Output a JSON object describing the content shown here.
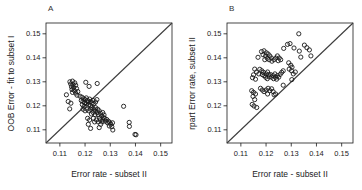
{
  "figure": {
    "background": "#ffffff",
    "axis_color": "#1a1a1a",
    "point_color": "#1a1a1a",
    "diagonal_color": "#3c3c3c",
    "panels": [
      {
        "label": "A",
        "xlabel": "Error rate - subset II",
        "ylabel": "OOB Error - fit to subset I"
      },
      {
        "label": "B",
        "xlabel": "Error rate - subset II",
        "ylabel": "rpart Error rate, subset II"
      }
    ]
  },
  "chart_data": [
    {
      "type": "scatter",
      "panel": "A",
      "title": "",
      "xlabel": "Error rate - subset II",
      "ylabel": "OOB Error - fit to subset I",
      "xlim": [
        0.1045,
        0.1545
      ],
      "ylim": [
        0.1045,
        0.1545
      ],
      "x_ticks": [
        0.11,
        0.12,
        0.13,
        0.14,
        0.15
      ],
      "y_ticks": [
        0.11,
        0.12,
        0.13,
        0.14,
        0.15
      ],
      "grid": false,
      "legend": "none",
      "marker": "open-circle",
      "reference_line": "identity diagonal y=x",
      "points": [
        [
          0.114,
          0.13
        ],
        [
          0.115,
          0.1303
        ],
        [
          0.1159,
          0.1296
        ],
        [
          0.1143,
          0.1291
        ],
        [
          0.1152,
          0.1288
        ],
        [
          0.1163,
          0.1286
        ],
        [
          0.1146,
          0.1279
        ],
        [
          0.1155,
          0.1276
        ],
        [
          0.1166,
          0.1272
        ],
        [
          0.1148,
          0.1268
        ],
        [
          0.1158,
          0.1263
        ],
        [
          0.115,
          0.1256
        ],
        [
          0.1163,
          0.1253
        ],
        [
          0.1171,
          0.1259
        ],
        [
          0.1168,
          0.1244
        ],
        [
          0.1126,
          0.1246
        ],
        [
          0.1133,
          0.1218
        ],
        [
          0.1139,
          0.1187
        ],
        [
          0.1144,
          0.1211
        ],
        [
          0.1203,
          0.1298
        ],
        [
          0.1248,
          0.1293
        ],
        [
          0.1216,
          0.1281
        ],
        [
          0.118,
          0.124
        ],
        [
          0.1188,
          0.1236
        ],
        [
          0.1195,
          0.1229
        ],
        [
          0.1185,
          0.1222
        ],
        [
          0.1192,
          0.1218
        ],
        [
          0.12,
          0.1226
        ],
        [
          0.1205,
          0.1233
        ],
        [
          0.121,
          0.1222
        ],
        [
          0.1198,
          0.1213
        ],
        [
          0.1206,
          0.1208
        ],
        [
          0.1212,
          0.1216
        ],
        [
          0.1218,
          0.1228
        ],
        [
          0.1221,
          0.1218
        ],
        [
          0.1215,
          0.1205
        ],
        [
          0.1222,
          0.12
        ],
        [
          0.1228,
          0.1212
        ],
        [
          0.1231,
          0.1222
        ],
        [
          0.1235,
          0.1209
        ],
        [
          0.1189,
          0.1205
        ],
        [
          0.1196,
          0.1198
        ],
        [
          0.1242,
          0.1216
        ],
        [
          0.1247,
          0.1226
        ],
        [
          0.1192,
          0.1186
        ],
        [
          0.12,
          0.1179
        ],
        [
          0.1208,
          0.1186
        ],
        [
          0.1215,
          0.1179
        ],
        [
          0.1222,
          0.1186
        ],
        [
          0.1228,
          0.1192
        ],
        [
          0.1235,
          0.1186
        ],
        [
          0.1242,
          0.1192
        ],
        [
          0.124,
          0.1179
        ],
        [
          0.1232,
          0.1172
        ],
        [
          0.1225,
          0.1166
        ],
        [
          0.124,
          0.1163
        ],
        [
          0.1248,
          0.1172
        ],
        [
          0.125,
          0.1186
        ],
        [
          0.1256,
          0.1179
        ],
        [
          0.1252,
          0.1163
        ],
        [
          0.1261,
          0.1169
        ],
        [
          0.1266,
          0.1158
        ],
        [
          0.1258,
          0.1149
        ],
        [
          0.127,
          0.1172
        ],
        [
          0.1275,
          0.1162
        ],
        [
          0.1272,
          0.1151
        ],
        [
          0.121,
          0.1148
        ],
        [
          0.1218,
          0.1141
        ],
        [
          0.1213,
          0.1123
        ],
        [
          0.1222,
          0.1106
        ],
        [
          0.1233,
          0.1148
        ],
        [
          0.1238,
          0.1133
        ],
        [
          0.1245,
          0.1141
        ],
        [
          0.1252,
          0.1133
        ],
        [
          0.126,
          0.1141
        ],
        [
          0.1268,
          0.1133
        ],
        [
          0.1262,
          0.1123
        ],
        [
          0.1271,
          0.1141
        ],
        [
          0.1278,
          0.1148
        ],
        [
          0.1281,
          0.1136
        ],
        [
          0.1286,
          0.1143
        ],
        [
          0.1289,
          0.1129
        ],
        [
          0.1293,
          0.1136
        ],
        [
          0.1299,
          0.1129
        ],
        [
          0.1296,
          0.1116
        ],
        [
          0.1302,
          0.1123
        ],
        [
          0.1309,
          0.1129
        ],
        [
          0.1256,
          0.1109
        ],
        [
          0.1306,
          0.1113
        ],
        [
          0.1353,
          0.1198
        ],
        [
          0.1375,
          0.1131
        ],
        [
          0.1376,
          0.1114
        ],
        [
          0.131,
          0.1099
        ],
        [
          0.1398,
          0.1081
        ],
        [
          0.1402,
          0.1079
        ]
      ]
    },
    {
      "type": "scatter",
      "panel": "B",
      "title": "",
      "xlabel": "Error rate - subset II",
      "ylabel": "rpart Error rate, subset II",
      "xlim": [
        0.1045,
        0.1545
      ],
      "ylim": [
        0.1045,
        0.1545
      ],
      "x_ticks": [
        0.11,
        0.12,
        0.13,
        0.14,
        0.15
      ],
      "y_ticks": [
        0.11,
        0.12,
        0.13,
        0.14,
        0.15
      ],
      "grid": false,
      "legend": "none",
      "marker": "open-circle",
      "reference_line": "identity diagonal y=x",
      "points": [
        [
          0.133,
          0.15
        ],
        [
          0.1285,
          0.1456
        ],
        [
          0.1295,
          0.1459
        ],
        [
          0.1352,
          0.1453
        ],
        [
          0.1311,
          0.1441
        ],
        [
          0.1372,
          0.1433
        ],
        [
          0.1332,
          0.1428
        ],
        [
          0.1378,
          0.1408
        ],
        [
          0.1338,
          0.1403
        ],
        [
          0.1362,
          0.1442
        ],
        [
          0.127,
          0.1439
        ],
        [
          0.1182,
          0.1426
        ],
        [
          0.1192,
          0.1429
        ],
        [
          0.1201,
          0.1421
        ],
        [
          0.1188,
          0.1413
        ],
        [
          0.1198,
          0.1408
        ],
        [
          0.1208,
          0.1416
        ],
        [
          0.1215,
          0.1408
        ],
        [
          0.1205,
          0.1398
        ],
        [
          0.1195,
          0.1392
        ],
        [
          0.1212,
          0.1392
        ],
        [
          0.1221,
          0.1399
        ],
        [
          0.1223,
          0.1386
        ],
        [
          0.1232,
          0.1392
        ],
        [
          0.1239,
          0.1399
        ],
        [
          0.1245,
          0.1408
        ],
        [
          0.1252,
          0.1399
        ],
        [
          0.1248,
          0.1388
        ],
        [
          0.1258,
          0.1392
        ],
        [
          0.1168,
          0.1402
        ],
        [
          0.1155,
          0.1353
        ],
        [
          0.1162,
          0.1341
        ],
        [
          0.115,
          0.1329
        ],
        [
          0.1171,
          0.1333
        ],
        [
          0.1146,
          0.1317
        ],
        [
          0.1158,
          0.1311
        ],
        [
          0.1175,
          0.1352
        ],
        [
          0.1183,
          0.1346
        ],
        [
          0.119,
          0.1339
        ],
        [
          0.1185,
          0.133
        ],
        [
          0.1192,
          0.1326
        ],
        [
          0.12,
          0.1333
        ],
        [
          0.1206,
          0.1341
        ],
        [
          0.121,
          0.133
        ],
        [
          0.1198,
          0.1319
        ],
        [
          0.1205,
          0.1313
        ],
        [
          0.1212,
          0.1321
        ],
        [
          0.1218,
          0.133
        ],
        [
          0.1222,
          0.1319
        ],
        [
          0.1228,
          0.1326
        ],
        [
          0.1235,
          0.1333
        ],
        [
          0.123,
          0.1313
        ],
        [
          0.1238,
          0.1319
        ],
        [
          0.1245,
          0.1326
        ],
        [
          0.1242,
          0.1311
        ],
        [
          0.125,
          0.1319
        ],
        [
          0.1256,
          0.1331
        ],
        [
          0.1262,
          0.1339
        ],
        [
          0.1268,
          0.1346
        ],
        [
          0.129,
          0.1379
        ],
        [
          0.1298,
          0.1369
        ],
        [
          0.1292,
          0.1353
        ],
        [
          0.1301,
          0.1346
        ],
        [
          0.1308,
          0.1333
        ],
        [
          0.1316,
          0.1341
        ],
        [
          0.1303,
          0.1361
        ],
        [
          0.1143,
          0.1263
        ],
        [
          0.115,
          0.1256
        ],
        [
          0.1158,
          0.1249
        ],
        [
          0.1148,
          0.1239
        ],
        [
          0.1155,
          0.1226
        ],
        [
          0.1145,
          0.1206
        ],
        [
          0.1152,
          0.1199
        ],
        [
          0.1163,
          0.1193
        ],
        [
          0.1178,
          0.1273
        ],
        [
          0.1185,
          0.1266
        ],
        [
          0.1192,
          0.1259
        ],
        [
          0.12,
          0.1266
        ],
        [
          0.1208,
          0.1273
        ],
        [
          0.1215,
          0.1263
        ],
        [
          0.1222,
          0.1271
        ],
        [
          0.1206,
          0.1249
        ],
        [
          0.1232,
          0.1246
        ],
        [
          0.1228,
          0.1259
        ],
        [
          0.1238,
          0.1249
        ],
        [
          0.1268,
          0.1286
        ],
        [
          0.1302,
          0.1309
        ]
      ]
    }
  ]
}
